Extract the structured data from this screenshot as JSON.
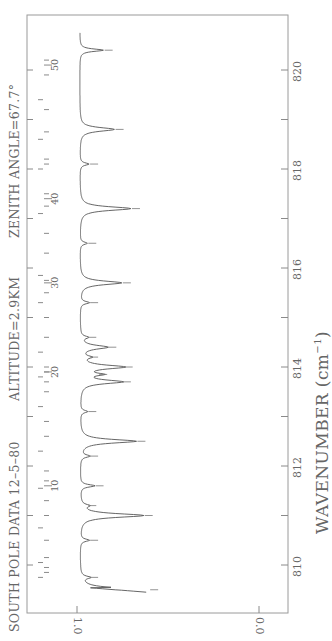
{
  "chart_data": {
    "type": "line",
    "annotations": [
      "ALTITUDE=2.9KM",
      "ZENITH ANGLE=67.7°"
    ],
    "xlabel": "WAVENUMBER (cm⁻¹)",
    "ylabel": "",
    "xlim": [
      809.4,
      820.9
    ],
    "ylim": [
      0.0,
      1.0
    ],
    "x_ticks": [
      810,
      812,
      814,
      816,
      818,
      820
    ],
    "x_tick_labels": [
      "810",
      "812",
      "814",
      "816",
      "818",
      "820"
    ],
    "y_ticks": [
      0.0,
      1.0
    ],
    "y_tick_labels": [
      "0.0",
      "1.0"
    ],
    "orientation": "rotated 90° counter-clockwise (wavenumber increases upward)",
    "grid": false,
    "line_markers": {
      "labels": [
        "10",
        "20",
        "30",
        "40",
        "50"
      ],
      "label_positions_wavenumber": [
        811.6,
        813.9,
        815.7,
        817.4,
        820.1
      ]
    },
    "series": [
      {
        "name": "observed transmittance",
        "x": [
          809.5,
          809.75,
          810.1,
          810.5,
          810.8,
          811.0,
          811.2,
          811.5,
          811.6,
          811.9,
          812.2,
          812.5,
          812.8,
          813.1,
          813.4,
          813.7,
          813.85,
          814.0,
          814.2,
          814.4,
          814.6,
          815.0,
          815.3,
          815.7,
          816.1,
          816.5,
          816.9,
          817.2,
          817.5,
          817.9,
          818.1,
          818.4,
          818.8,
          819.2,
          819.6,
          820.0,
          820.4,
          820.7
        ],
        "values": [
          0.62,
          0.95,
          0.98,
          0.95,
          0.97,
          0.65,
          0.96,
          0.97,
          0.92,
          0.98,
          0.95,
          0.69,
          0.97,
          0.96,
          0.97,
          0.77,
          0.9,
          0.76,
          0.95,
          0.85,
          0.96,
          0.97,
          0.95,
          0.77,
          0.98,
          0.96,
          0.97,
          0.72,
          0.98,
          0.97,
          0.95,
          0.97,
          0.81,
          0.97,
          0.97,
          0.98,
          0.87,
          0.99
        ]
      }
    ]
  },
  "header": {
    "title": "SOUTH POLE DATA 12–5–80",
    "altitude": "ALTITUDE=2.9KM",
    "zenith": "ZENITH ANGLE=67.7°"
  },
  "axes": {
    "x_label": "WAVENUMBER",
    "x_unit": "(cm",
    "x_unit_exp": "−1",
    "x_unit_close": ")",
    "x_ticks": [
      "810",
      "812",
      "814",
      "816",
      "818",
      "820"
    ],
    "y_ticks": [
      "1.0",
      "0.0"
    ],
    "line_labels": [
      "10",
      "20",
      "30",
      "40",
      "50"
    ]
  },
  "colors": {
    "axis": "#8a8a8a",
    "trace": "#555555",
    "text": "#666666"
  }
}
